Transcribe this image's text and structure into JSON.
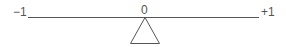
{
  "diagram": {
    "type": "number-line-balance",
    "labels": {
      "left": "−1",
      "center": "0",
      "right": "+1"
    },
    "line": {
      "x1": 28,
      "x2": 259,
      "y": 17
    },
    "fulcrum": {
      "shape": "triangle",
      "apex_x": 145,
      "apex_y": 17,
      "base_left": 130,
      "base_right": 160,
      "base_y": 44
    },
    "stroke_color": "#555555"
  }
}
